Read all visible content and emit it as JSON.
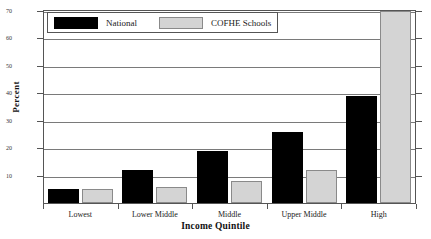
{
  "chart_data": {
    "type": "bar",
    "title": "",
    "xlabel": "Income Quintile",
    "ylabel": "Percent",
    "ylim": [
      0,
      70
    ],
    "yticks": [
      0,
      10,
      20,
      30,
      40,
      50,
      60,
      70
    ],
    "ytick_labels": [
      "0",
      "10",
      "20",
      "30",
      "40",
      "50",
      "60",
      "70"
    ],
    "grid": true,
    "legend_position": "top-left",
    "categories": [
      "Lowest",
      "Lower Middle",
      "Middle",
      "Upper Middle",
      "High"
    ],
    "series": [
      {
        "name": "National",
        "color": "#000000",
        "values": [
          5,
          12,
          19,
          26,
          39
        ]
      },
      {
        "name": "COFHE Schools",
        "color": "#d4d4d4",
        "values": [
          5,
          6,
          8,
          12,
          70
        ]
      }
    ]
  },
  "legend": {
    "items": [
      {
        "label": "National",
        "swatch": "black-square-swatch"
      },
      {
        "label": "COFHE Schools",
        "swatch": "gray-square-swatch"
      }
    ]
  },
  "axes": {
    "y_title": "Percent",
    "x_title": "Income Quintile"
  }
}
